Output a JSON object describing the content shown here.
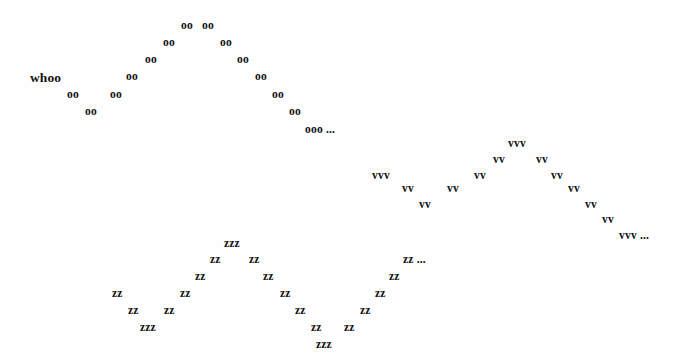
{
  "canvas": {
    "width": 692,
    "height": 360,
    "background_color": "#fefefe",
    "ink_color": "#111111"
  },
  "waves": [
    {
      "id": "whoo-wave",
      "name": "whoo-wave",
      "glyph": "oo",
      "lead_word": "whoo",
      "tail": "ooo ...",
      "tokens": [
        {
          "text": "whoo",
          "x": 30,
          "y": 71,
          "style": "word"
        },
        {
          "text": "oo",
          "x": 67,
          "y": 89,
          "style": "glyph"
        },
        {
          "text": "oo",
          "x": 85,
          "y": 106,
          "style": "glyph"
        },
        {
          "text": "oo",
          "x": 110,
          "y": 89,
          "style": "glyph"
        },
        {
          "text": "oo",
          "x": 126,
          "y": 71,
          "style": "glyph"
        },
        {
          "text": "oo",
          "x": 145,
          "y": 54,
          "style": "glyph"
        },
        {
          "text": "oo",
          "x": 163,
          "y": 37,
          "style": "glyph"
        },
        {
          "text": "oo",
          "x": 181,
          "y": 20,
          "style": "glyph"
        },
        {
          "text": "oo",
          "x": 202,
          "y": 20,
          "style": "glyph"
        },
        {
          "text": "oo",
          "x": 220,
          "y": 37,
          "style": "glyph"
        },
        {
          "text": "oo",
          "x": 237,
          "y": 54,
          "style": "glyph"
        },
        {
          "text": "oo",
          "x": 255,
          "y": 71,
          "style": "glyph"
        },
        {
          "text": "oo",
          "x": 272,
          "y": 89,
          "style": "glyph"
        },
        {
          "text": "oo",
          "x": 289,
          "y": 106,
          "style": "glyph"
        },
        {
          "text": "ooo ...",
          "x": 305,
          "y": 124,
          "style": "tail"
        }
      ]
    },
    {
      "id": "vvv-wave",
      "name": "vvv-wave",
      "glyph": "vv",
      "tail": "vvv ...",
      "tokens": [
        {
          "text": "vvv",
          "x": 372,
          "y": 170,
          "style": "glyph"
        },
        {
          "text": "vv",
          "x": 402,
          "y": 183,
          "style": "glyph"
        },
        {
          "text": "vv",
          "x": 419,
          "y": 199,
          "style": "glyph"
        },
        {
          "text": "vv",
          "x": 447,
          "y": 183,
          "style": "glyph"
        },
        {
          "text": "vv",
          "x": 474,
          "y": 170,
          "style": "glyph"
        },
        {
          "text": "vv",
          "x": 493,
          "y": 154,
          "style": "glyph"
        },
        {
          "text": "vvv",
          "x": 508,
          "y": 138,
          "style": "glyph"
        },
        {
          "text": "vv",
          "x": 536,
          "y": 154,
          "style": "glyph"
        },
        {
          "text": "vv",
          "x": 551,
          "y": 170,
          "style": "glyph"
        },
        {
          "text": "vv",
          "x": 568,
          "y": 183,
          "style": "glyph"
        },
        {
          "text": "vv",
          "x": 585,
          "y": 199,
          "style": "glyph"
        },
        {
          "text": "vv",
          "x": 602,
          "y": 214,
          "style": "glyph"
        },
        {
          "text": "vvv ...",
          "x": 619,
          "y": 230,
          "style": "tail"
        }
      ]
    },
    {
      "id": "zzz-wave",
      "name": "zzz-wave",
      "glyph": "zz",
      "tail": "zz ...",
      "tokens": [
        {
          "text": "zz",
          "x": 112,
          "y": 288,
          "style": "glyph"
        },
        {
          "text": "zz",
          "x": 128,
          "y": 305,
          "style": "glyph"
        },
        {
          "text": "zzz",
          "x": 140,
          "y": 322,
          "style": "glyph"
        },
        {
          "text": "zz",
          "x": 164,
          "y": 305,
          "style": "glyph"
        },
        {
          "text": "zz",
          "x": 180,
          "y": 288,
          "style": "glyph"
        },
        {
          "text": "zz",
          "x": 195,
          "y": 271,
          "style": "glyph"
        },
        {
          "text": "zz",
          "x": 210,
          "y": 254,
          "style": "glyph"
        },
        {
          "text": "zzz",
          "x": 224,
          "y": 238,
          "style": "glyph"
        },
        {
          "text": "zz",
          "x": 249,
          "y": 254,
          "style": "glyph"
        },
        {
          "text": "zz",
          "x": 263,
          "y": 271,
          "style": "glyph"
        },
        {
          "text": "zz",
          "x": 280,
          "y": 288,
          "style": "glyph"
        },
        {
          "text": "zz",
          "x": 295,
          "y": 305,
          "style": "glyph"
        },
        {
          "text": "zz",
          "x": 311,
          "y": 322,
          "style": "glyph"
        },
        {
          "text": "zzz",
          "x": 316,
          "y": 339,
          "style": "glyph"
        },
        {
          "text": "zz",
          "x": 344,
          "y": 322,
          "style": "glyph"
        },
        {
          "text": "zz",
          "x": 360,
          "y": 305,
          "style": "glyph"
        },
        {
          "text": "zz",
          "x": 375,
          "y": 288,
          "style": "glyph"
        },
        {
          "text": "zz",
          "x": 389,
          "y": 271,
          "style": "glyph"
        },
        {
          "text": "zz ...",
          "x": 403,
          "y": 254,
          "style": "tail"
        }
      ]
    }
  ]
}
